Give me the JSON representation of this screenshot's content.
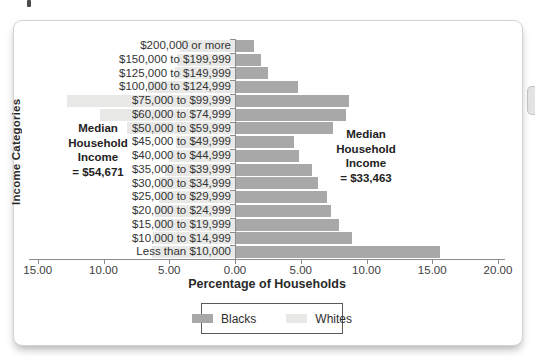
{
  "chart_data": {
    "type": "bar",
    "subtype": "butterfly",
    "title": "",
    "xlabel": "Percentage of Households",
    "ylabel": "Income Categories",
    "grid": false,
    "legend_position": "bottom-center",
    "xlim_left_side": 15,
    "xlim_right_side": 20,
    "categories": [
      "$200,000 or more",
      "$150,000 to $199,999",
      "$125,000 to $149,999",
      "$100,000 to $124,999",
      "$75,000 to $99,999",
      "$60,000 to $74,999",
      "$50,000 to $59,999",
      "$45,000 to $49,999",
      "$40,000 to $44,999",
      "$35,000 to $39,999",
      "$30,000 to $34,999",
      "$25,000 to $29,999",
      "$20,000 to $24,999",
      "$15,000 to $19,999",
      "$10,000 to $14,999",
      "Less than $10,000"
    ],
    "series": [
      {
        "name": "Blacks",
        "side": "right",
        "color": "#a7a8a7",
        "values": [
          1.4,
          1.9,
          2.4,
          4.7,
          8.6,
          8.4,
          7.4,
          4.4,
          4.8,
          5.8,
          6.2,
          6.9,
          7.2,
          7.8,
          8.8,
          15.5
        ]
      },
      {
        "name": "Whites",
        "side": "left",
        "color": "#e8e8e6",
        "values": [
          4.2,
          4.4,
          4.6,
          6.6,
          12.8,
          10.3,
          8.2,
          4.5,
          5.0,
          5.3,
          5.8,
          5.8,
          6.1,
          6.0,
          6.2,
          6.3
        ]
      }
    ],
    "x_ticks": [
      {
        "label": "15.00",
        "side": "left"
      },
      {
        "label": "10.00",
        "side": "left"
      },
      {
        "label": "5.00",
        "side": "left"
      },
      {
        "label": "0.00",
        "side": "zero"
      },
      {
        "label": "5.00",
        "side": "right"
      },
      {
        "label": "10.00",
        "side": "right"
      },
      {
        "label": "15.00",
        "side": "right"
      },
      {
        "label": "20.00",
        "side": "right"
      }
    ],
    "annotations": [
      {
        "id": "median-left",
        "lines": [
          "Median",
          "Household",
          "Income",
          "= $54,671"
        ]
      },
      {
        "id": "median-right",
        "lines": [
          "Median",
          "Household",
          "Income",
          "= $33,463"
        ]
      }
    ],
    "legend": [
      {
        "label": "Blacks",
        "color": "#a7a8a7"
      },
      {
        "label": "Whites",
        "color": "#e8e8e6"
      }
    ]
  }
}
